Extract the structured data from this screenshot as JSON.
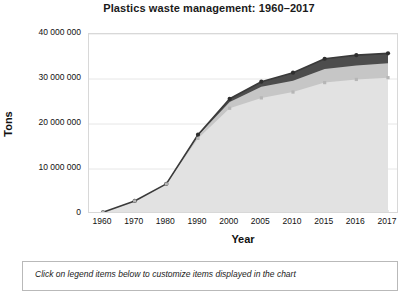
{
  "chart_data": {
    "type": "area",
    "title": "Plastics waste management: 1960–2017",
    "xlabel": "Year",
    "ylabel": "Tons",
    "x": [
      1960,
      1970,
      1980,
      1990,
      2000,
      2005,
      2010,
      2015,
      2016,
      2017
    ],
    "categories": [
      "1960",
      "1970",
      "1980",
      "1990",
      "2000",
      "2005",
      "2010",
      "2015",
      "2016",
      "2017"
    ],
    "ylim": [
      0,
      40000000
    ],
    "ytick_values": [
      0,
      10000000,
      20000000,
      30000000,
      40000000
    ],
    "ytick_labels": [
      "0",
      "10 000 000",
      "20 000 000",
      "30 000 000",
      "40 000 000"
    ],
    "grid": true,
    "stacked": true,
    "legend_position": "below",
    "series": [
      {
        "name": "landfilled",
        "color": "#e2e2e2",
        "values": [
          390000,
          2900000,
          6670000,
          16800000,
          23500000,
          25800000,
          27100000,
          29200000,
          29900000,
          30300000
        ]
      },
      {
        "name": "combusted",
        "color": "#c6c6c6",
        "values": [
          0,
          0,
          10000,
          670000,
          1400000,
          2500000,
          2500000,
          3000000,
          3100000,
          3200000
        ]
      },
      {
        "name": "recycled",
        "color": "#4d4d4d",
        "values": [
          0,
          0,
          10000,
          150000,
          700000,
          1100000,
          1800000,
          2300000,
          2300000,
          2200000
        ]
      }
    ],
    "totals": [
      390000,
      2900000,
      6690000,
      17620000,
      25600000,
      29400000,
      31400000,
      34500000,
      35300000,
      35700000
    ]
  },
  "legend_box": {
    "hint": "Click on legend items below to customize items displayed in the chart"
  }
}
